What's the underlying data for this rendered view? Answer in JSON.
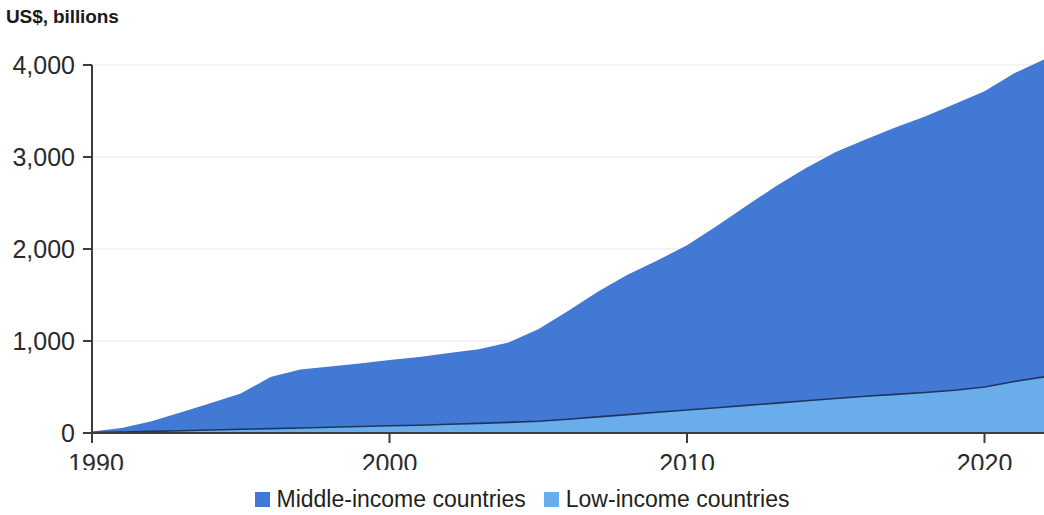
{
  "unit_label": "US$, billions",
  "colors": {
    "middle_income": "#4179d4",
    "low_income": "#69aeea",
    "axis": "#3d3d3d",
    "grid": "#eceff3",
    "series_outline": "#1f3560",
    "text": "#231f20"
  },
  "legend": {
    "items": [
      {
        "label": "Middle-income countries",
        "color_key": "middle_income"
      },
      {
        "label": "Low-income countries",
        "color_key": "low_income"
      }
    ]
  },
  "axes": {
    "y_ticks": [
      "0",
      "1,000",
      "2,000",
      "3,000",
      "4,000"
    ],
    "x_ticks": [
      "1990",
      "2000",
      "2010",
      "2020"
    ]
  },
  "chart_data": {
    "type": "area",
    "stacked": true,
    "title": "",
    "subtitle": "",
    "xlabel": "",
    "ylabel": "US$, billions",
    "xlim": [
      1990,
      2022
    ],
    "ylim": [
      0,
      4200
    ],
    "grid": true,
    "legend_position": "bottom-center",
    "x": [
      1990,
      1991,
      1992,
      1993,
      1994,
      1995,
      1996,
      1997,
      1998,
      1999,
      2000,
      2001,
      2002,
      2003,
      2004,
      2005,
      2006,
      2007,
      2008,
      2009,
      2010,
      2011,
      2012,
      2013,
      2014,
      2015,
      2016,
      2017,
      2018,
      2019,
      2020,
      2021,
      2022
    ],
    "y_tick_values": [
      0,
      1000,
      2000,
      3000,
      4000
    ],
    "x_tick_values": [
      1990,
      2000,
      2010,
      2020
    ],
    "series": [
      {
        "name": "Low-income countries",
        "color": "#69aeea",
        "values": [
          5,
          10,
          18,
          25,
          32,
          40,
          48,
          55,
          62,
          70,
          78,
          85,
          95,
          105,
          115,
          128,
          150,
          175,
          200,
          225,
          250,
          275,
          300,
          325,
          350,
          375,
          400,
          420,
          440,
          465,
          500,
          560,
          610
        ]
      },
      {
        "name": "Middle-income countries",
        "color": "#4179d4",
        "values": [
          10,
          45,
          110,
          200,
          295,
          390,
          560,
          635,
          660,
          685,
          715,
          740,
          775,
          805,
          870,
          1000,
          1175,
          1360,
          1520,
          1650,
          1790,
          1975,
          2170,
          2360,
          2530,
          2680,
          2790,
          2900,
          3000,
          3110,
          3215,
          3350,
          3450
        ]
      }
    ],
    "totals": [
      15,
      55,
      128,
      225,
      327,
      430,
      608,
      690,
      722,
      755,
      793,
      825,
      870,
      910,
      985,
      1128,
      1325,
      1535,
      1720,
      1875,
      2040,
      2250,
      2470,
      2685,
      2880,
      3055,
      3190,
      3320,
      3440,
      3575,
      3715,
      3910,
      4060
    ]
  }
}
